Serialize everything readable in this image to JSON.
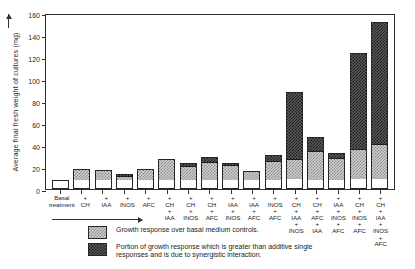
{
  "chart_data": {
    "type": "bar",
    "stacked": true,
    "title": "",
    "xlabel": "Basal treatment",
    "ylabel": "Average final fresh weight of cultures (mg)",
    "ylim": [
      0,
      160
    ],
    "yticks": [
      0,
      20,
      40,
      60,
      80,
      100,
      120,
      140,
      160
    ],
    "ytick_labels": [
      "0",
      "20",
      "40",
      "60",
      "80",
      "100",
      "120",
      "140",
      "160"
    ],
    "grid": false,
    "legend_position": "below-axis",
    "categories": [
      "Basal\ntreatment",
      "+\nCH",
      "+\nIAA",
      "+\nINOS",
      "+\nAFC",
      "+\nCH\n+\nIAA",
      "+\nCH\n+\nINOS",
      "+\nCH\n+\nAFC",
      "+\nIAA\n+\nINOS",
      "+\nIAA\n+\nAFC",
      "+\nINOS\n+\nAFC",
      "+\nCH\n+\nIAA\n+\nINOS",
      "+\nCH\n+\nAFC\n+\nIAA",
      "+\nIAA\n+\nINOS\n+\nAFC",
      "+\nCH\n+\nINOS\n+\nAFC",
      "+\nCH\n+\nIAA\n+\nINOS\n+\nAFC"
    ],
    "series": [
      {
        "name": "Basal medium control",
        "key": "basal",
        "fill": "white",
        "values": [
          8,
          8,
          8,
          8,
          8,
          8,
          8,
          8,
          8,
          8,
          8,
          8,
          8,
          8,
          8,
          8
        ]
      },
      {
        "name": "Growth response over basal medium controls.",
        "key": "response",
        "fill": "light-crosshatch",
        "values": [
          0,
          10,
          9,
          4,
          10,
          19,
          13,
          16,
          14,
          8,
          17,
          18,
          26,
          20,
          27,
          32
        ]
      },
      {
        "name": "Portion of growth response which is greater than additive single responses and is due to synergistic interaction.",
        "key": "synergy",
        "fill": "dark-crosshatch",
        "values": [
          0,
          0,
          0,
          2,
          0,
          0,
          3,
          5,
          2,
          0,
          6,
          62,
          13,
          5,
          89,
          112
        ]
      }
    ],
    "totals": [
      8,
      18,
      17,
      14,
      18,
      27,
      24,
      29,
      24,
      16,
      31,
      88,
      47,
      33,
      124,
      152
    ]
  },
  "legend": {
    "items": [
      {
        "swatch": "light-crosshatch",
        "text": "Growth response over basal medium controls."
      },
      {
        "swatch": "dark-crosshatch",
        "text": "Portion of growth response which is greater than additive single\nresponses and is due to synergistic interaction."
      }
    ]
  }
}
